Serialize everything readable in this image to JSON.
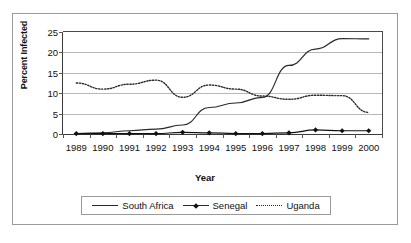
{
  "chart_data": {
    "type": "line",
    "title": "",
    "xlabel": "Year",
    "ylabel": "Percent Infected",
    "xlim": [
      1989,
      2000
    ],
    "ylim": [
      0,
      25
    ],
    "yticks": [
      0,
      5,
      10,
      15,
      20,
      25
    ],
    "grid": true,
    "legend_position": "bottom",
    "categories": [
      1989,
      1990,
      1991,
      1992,
      1993,
      1994,
      1995,
      1996,
      1997,
      1998,
      1999,
      2000
    ],
    "series": [
      {
        "name": "South Africa",
        "style": "solid",
        "marker": "none",
        "color": "#2a2a2a",
        "values": [
          0.1,
          0.3,
          0.8,
          1.2,
          2.2,
          6.5,
          7.6,
          9.0,
          16.8,
          20.8,
          23.4,
          23.3
        ]
      },
      {
        "name": "Senegal",
        "style": "solid",
        "marker": "diamond",
        "color": "#111111",
        "values": [
          0.1,
          0.1,
          0.1,
          0.1,
          0.4,
          0.3,
          0.1,
          0.1,
          0.3,
          1.0,
          0.8,
          0.8
        ]
      },
      {
        "name": "Uganda",
        "style": "dotted",
        "marker": "none",
        "color": "#2a2a2a",
        "values": [
          12.5,
          11.0,
          12.2,
          13.2,
          9.0,
          12.0,
          11.0,
          9.3,
          8.5,
          9.5,
          9.4,
          5.3
        ]
      }
    ]
  },
  "axis": {
    "y_title": "Percent Infected",
    "x_title": "Year",
    "y_tick_labels": [
      "0",
      "5",
      "10",
      "15",
      "20",
      "25"
    ],
    "x_tick_labels": [
      "1989",
      "1990",
      "1991",
      "1992",
      "1993",
      "1994",
      "1995",
      "1996",
      "1997",
      "1998",
      "1999",
      "2000"
    ]
  },
  "legend": {
    "entries": [
      {
        "label": "South Africa"
      },
      {
        "label": "Senegal"
      },
      {
        "label": "Uganda"
      }
    ]
  }
}
